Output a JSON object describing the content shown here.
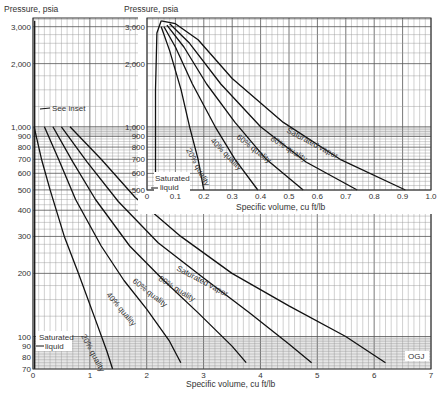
{
  "chart_data": [
    {
      "id": "main",
      "type": "line",
      "title": "",
      "xlabel": "Specific volume, cu ft/lb",
      "ylabel": "Pressure, psia",
      "xlim": [
        0,
        7
      ],
      "ylim": [
        70,
        3300
      ],
      "yscale": "log",
      "grid": true,
      "x_ticks": [
        "0",
        "1",
        "2",
        "3",
        "4",
        "5",
        "6",
        "7"
      ],
      "y_ticks": [
        "70",
        "80",
        "90",
        "100",
        "200",
        "300",
        "400",
        "500",
        "600",
        "700",
        "800",
        "900",
        "1,000",
        "2,000",
        "3,000"
      ],
      "series": [
        {
          "name": "Saturated liquid",
          "points": [
            [
              0.03,
              70
            ],
            [
              0.03,
              1000
            ],
            [
              0.03,
              3200
            ]
          ]
        },
        {
          "name": "20% quality",
          "points": [
            [
              0.02,
              1000
            ],
            [
              0.15,
              700
            ],
            [
              0.3,
              500
            ],
            [
              0.55,
              300
            ],
            [
              0.8,
              200
            ],
            [
              1.1,
              120
            ],
            [
              1.3,
              85
            ],
            [
              1.4,
              70
            ]
          ]
        },
        {
          "name": "40% quality",
          "points": [
            [
              0.2,
              1000
            ],
            [
              0.45,
              700
            ],
            [
              0.75,
              450
            ],
            [
              1.2,
              270
            ],
            [
              1.6,
              185
            ],
            [
              2.0,
              135
            ],
            [
              2.4,
              95
            ],
            [
              2.6,
              75
            ]
          ]
        },
        {
          "name": "60% quality",
          "points": [
            [
              0.35,
              1000
            ],
            [
              0.7,
              680
            ],
            [
              1.1,
              450
            ],
            [
              1.7,
              270
            ],
            [
              2.3,
              185
            ],
            [
              2.9,
              130
            ],
            [
              3.5,
              90
            ],
            [
              3.75,
              75
            ]
          ]
        },
        {
          "name": "80% quality",
          "points": [
            [
              0.5,
              1000
            ],
            [
              0.95,
              680
            ],
            [
              1.5,
              440
            ],
            [
              2.2,
              280
            ],
            [
              3.0,
              190
            ],
            [
              3.8,
              130
            ],
            [
              4.5,
              92
            ],
            [
              4.9,
              75
            ]
          ]
        },
        {
          "name": "Saturated vapor",
          "points": [
            [
              0.65,
              1000
            ],
            [
              1.2,
              700
            ],
            [
              1.8,
              460
            ],
            [
              2.6,
              300
            ],
            [
              3.5,
              200
            ],
            [
              4.5,
              140
            ],
            [
              5.5,
              100
            ],
            [
              6.2,
              75
            ]
          ]
        }
      ],
      "annotations": [
        "See inset",
        "Saturated liquid",
        "20% quality",
        "40% quality",
        "60% quality",
        "80% quality",
        "Saturated vapor",
        "OGJ"
      ]
    },
    {
      "id": "inset",
      "type": "line",
      "title": "",
      "xlabel": "Specific volume, cu ft/lb",
      "ylabel": "Pressure, psia",
      "xlim": [
        0,
        1.0
      ],
      "ylim": [
        500,
        3300
      ],
      "yscale": "log",
      "grid": true,
      "x_ticks": [
        "0",
        "0.1",
        "0.2",
        "0.3",
        "0.4",
        "0.5",
        "0.6",
        "0.7",
        "0.8",
        "0.9",
        "1.0"
      ],
      "y_ticks": [
        "500",
        "600",
        "700",
        "800",
        "900",
        "1,000",
        "2,000",
        "3,000"
      ],
      "series": [
        {
          "name": "Saturated liquid",
          "points": [
            [
              0.03,
              500
            ],
            [
              0.03,
              1500
            ],
            [
              0.035,
              2800
            ],
            [
              0.05,
              3200
            ]
          ]
        },
        {
          "name": "20% quality",
          "points": [
            [
              0.05,
              3000
            ],
            [
              0.08,
              2300
            ],
            [
              0.12,
              1500
            ],
            [
              0.15,
              1000
            ],
            [
              0.18,
              700
            ],
            [
              0.2,
              500
            ]
          ]
        },
        {
          "name": "40% quality",
          "points": [
            [
              0.06,
              3000
            ],
            [
              0.1,
              2400
            ],
            [
              0.16,
              1600
            ],
            [
              0.24,
              1000
            ],
            [
              0.31,
              700
            ],
            [
              0.39,
              500
            ]
          ]
        },
        {
          "name": "60% quality",
          "points": [
            [
              0.07,
              3050
            ],
            [
              0.13,
              2400
            ],
            [
              0.21,
              1600
            ],
            [
              0.31,
              1050
            ],
            [
              0.42,
              700
            ],
            [
              0.55,
              500
            ]
          ]
        },
        {
          "name": "80% quality",
          "points": [
            [
              0.08,
              3100
            ],
            [
              0.15,
              2500
            ],
            [
              0.26,
              1600
            ],
            [
              0.4,
              1000
            ],
            [
              0.56,
              680
            ],
            [
              0.74,
              500
            ]
          ]
        },
        {
          "name": "Saturated vapor",
          "points": [
            [
              0.05,
              3200
            ],
            [
              0.1,
              3100
            ],
            [
              0.18,
              2600
            ],
            [
              0.3,
              1700
            ],
            [
              0.48,
              1050
            ],
            [
              0.68,
              700
            ],
            [
              0.91,
              500
            ]
          ]
        }
      ],
      "annotations": [
        "Saturated liquid",
        "20% quality",
        "40% quality",
        "60% quality",
        "80% quality",
        "Saturated vapor"
      ]
    }
  ],
  "labels": {
    "main_ylabel": "Pressure, psia",
    "main_xlabel": "Specific volume, cu ft/lb",
    "inset_ylabel": "Pressure, psia",
    "inset_xlabel": "Specific volume, cu ft/lb",
    "see_inset": "See inset",
    "sat_liquid_1": "Saturated",
    "sat_liquid_2": "liquid",
    "q20": "20% quality",
    "q40": "40% quality",
    "q60": "60% quality",
    "q80": "80% quality",
    "sat_vapor": "Saturated vapor",
    "credit": "OGJ"
  }
}
